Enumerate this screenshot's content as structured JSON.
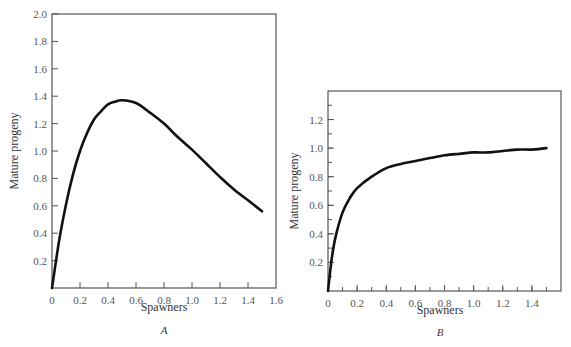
{
  "chart_data": [
    {
      "panel": "A",
      "type": "line",
      "title": "",
      "xlabel": "Spawners",
      "ylabel": "Mature progeny",
      "xlim": [
        0,
        1.6
      ],
      "ylim": [
        0,
        2.0
      ],
      "xticks": [
        "0",
        "0.2",
        "0.4",
        "0.6",
        "0.8",
        "1.0",
        "1.2",
        "1.4",
        "1.6"
      ],
      "yticks": [
        "0.2",
        "0.4",
        "0.6",
        "0.8",
        "1.0",
        "1.2",
        "1.4",
        "1.6",
        "1.8",
        "2.0"
      ],
      "grid": false,
      "series": [
        {
          "name": "Ricker-type stock-recruitment curve",
          "x": [
            0,
            0.05,
            0.1,
            0.15,
            0.2,
            0.25,
            0.3,
            0.35,
            0.4,
            0.45,
            0.5,
            0.6,
            0.7,
            0.8,
            0.9,
            1.0,
            1.1,
            1.2,
            1.3,
            1.4,
            1.5
          ],
          "y": [
            0,
            0.34,
            0.61,
            0.83,
            1.0,
            1.13,
            1.23,
            1.29,
            1.34,
            1.36,
            1.37,
            1.35,
            1.28,
            1.2,
            1.1,
            1.01,
            0.91,
            0.81,
            0.72,
            0.64,
            0.56
          ]
        }
      ]
    },
    {
      "panel": "B",
      "type": "line",
      "title": "",
      "xlabel": "Spawners",
      "ylabel": "Mature progeny",
      "xlim": [
        0,
        1.6
      ],
      "ylim": [
        0,
        1.4
      ],
      "xticks": [
        "0",
        "0.2",
        "0.4",
        "0.6",
        "0.8",
        "1.0",
        "1.2",
        "1.4"
      ],
      "yticks": [
        "0.2",
        "0.4",
        "0.6",
        "0.8",
        "1.0",
        "1.2"
      ],
      "grid": false,
      "series": [
        {
          "name": "Beverton-Holt-type stock-recruitment curve",
          "x": [
            0,
            0.025,
            0.05,
            0.1,
            0.15,
            0.2,
            0.3,
            0.4,
            0.5,
            0.6,
            0.7,
            0.8,
            0.9,
            1.0,
            1.1,
            1.2,
            1.3,
            1.4,
            1.5
          ],
          "y": [
            0,
            0.22,
            0.37,
            0.55,
            0.65,
            0.72,
            0.8,
            0.86,
            0.89,
            0.91,
            0.93,
            0.95,
            0.96,
            0.97,
            0.97,
            0.98,
            0.99,
            0.99,
            1.0
          ]
        }
      ]
    }
  ],
  "panels": {
    "a": {
      "label": "A",
      "xlabel": "Spawners",
      "ylabel": "Mature progeny",
      "xticks": [
        "0",
        "0.2",
        "0.4",
        "0.6",
        "0.8",
        "1.0",
        "1.2",
        "1.4",
        "1.6"
      ],
      "yticks": [
        "0.2",
        "0.4",
        "0.6",
        "0.8",
        "1.0",
        "1.2",
        "1.4",
        "1.6",
        "1.8",
        "2.0"
      ]
    },
    "b": {
      "label": "B",
      "xlabel": "Spawners",
      "ylabel": "Mature progeny",
      "xticks": [
        "0",
        "0.2",
        "0.4",
        "0.6",
        "0.8",
        "1.0",
        "1.2",
        "1.4"
      ],
      "yticks": [
        "0.2",
        "0.4",
        "0.6",
        "0.8",
        "1.0",
        "1.2"
      ]
    }
  }
}
